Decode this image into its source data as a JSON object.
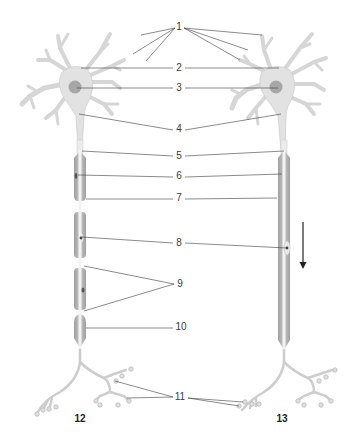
{
  "diagram": {
    "type": "anatomical-labeled-diagram",
    "colors": {
      "cell_body": "#e2e2e2",
      "cell_outline": "#c9c9c9",
      "nucleus": "#a5a5a5",
      "myelin": "#b4b4b4",
      "axon_core": "#f1f1f1",
      "leader_line": "#3c3c3c",
      "arrow": "#222222"
    },
    "labels": [
      {
        "id": "1",
        "text": "1",
        "x": 179,
        "y": 27
      },
      {
        "id": "2",
        "text": "2",
        "x": 179,
        "y": 68
      },
      {
        "id": "3",
        "text": "3",
        "x": 179,
        "y": 88
      },
      {
        "id": "4",
        "text": "4",
        "x": 179,
        "y": 129
      },
      {
        "id": "5",
        "text": "5",
        "x": 179,
        "y": 156
      },
      {
        "id": "6",
        "text": "6",
        "x": 179,
        "y": 176
      },
      {
        "id": "7",
        "text": "7",
        "x": 179,
        "y": 198
      },
      {
        "id": "8",
        "text": "8",
        "x": 179,
        "y": 243
      },
      {
        "id": "9",
        "text": "9",
        "x": 180,
        "y": 284
      },
      {
        "id": "10",
        "text": "10",
        "x": 181,
        "y": 327
      },
      {
        "id": "11",
        "text": "11",
        "x": 180,
        "y": 397
      }
    ],
    "captions": [
      {
        "id": "12",
        "text": "12",
        "x": 80,
        "y": 418
      },
      {
        "id": "13",
        "text": "13",
        "x": 282,
        "y": 418
      }
    ],
    "neurons": [
      {
        "caption": "12",
        "myelinated": true,
        "segments": 4
      },
      {
        "caption": "13",
        "myelinated": false,
        "segments": 1
      }
    ],
    "direction_arrow": {
      "direction": "down",
      "x": 303,
      "y1": 222,
      "y2": 268
    }
  }
}
